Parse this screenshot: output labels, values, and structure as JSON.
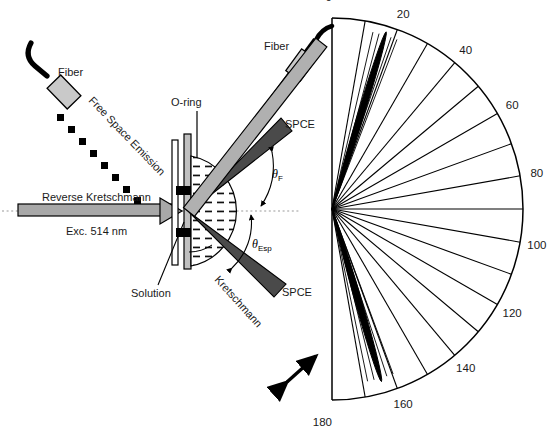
{
  "figure": {
    "background": "#ffffff",
    "width": 556,
    "height": 435
  },
  "schematic": {
    "labels": {
      "fiber_left": "Fiber",
      "fiber_right": "Fiber",
      "free_space_emission": "Free Space Emission",
      "o_ring": "O-ring",
      "spce_upper": "SPCE",
      "spce_lower": "SPCE",
      "reverse_kretschmann": "Reverse Kretschmann",
      "excitation": "Exc. 514 nm",
      "solution": "Solution",
      "kretschmann": "Kretschmann",
      "theta_f_symbol": "θ",
      "theta_f_sub": "F",
      "theta_esp_symbol": "θ",
      "theta_esp_sub": "Esp"
    },
    "colors": {
      "fiber_cable": "#000000",
      "fiber_connector": "#c9c9c9",
      "spce_beam": "#4a4a4a",
      "excitation_beam": "#a8a8a8",
      "kretschmann_arm": "#b0b0b0",
      "prism_fill": "#ffffff",
      "block_black": "#000000",
      "outline": "#000000",
      "axis_dotted": "#9a9a9a"
    },
    "geometry": {
      "optical_axis_y": 211,
      "sample_center_x": 188,
      "theta_f_degrees": 38,
      "theta_esp_degrees": 42
    }
  },
  "chart_data": {
    "type": "polar",
    "title": "",
    "xlabel": "",
    "ylabel": "",
    "angle_unit": "degrees",
    "angle_range": [
      0,
      180
    ],
    "orientation": "semicircle, 0 at top, 180 at bottom, opening to the right",
    "grid": {
      "radial_spokes_every": 10,
      "outer_arc": true,
      "spoke_count": 19
    },
    "tick_labels": [
      "0",
      "20",
      "40",
      "60",
      "80",
      "100",
      "120",
      "140",
      "160",
      "180"
    ],
    "tick_angles": [
      0,
      20,
      40,
      60,
      80,
      100,
      120,
      140,
      160,
      180
    ],
    "center_px": [
      332,
      209
    ],
    "radius_px": 191,
    "series": [
      {
        "name": "SPCE emission lobe (forward)",
        "peak_angle": 17,
        "peak_radius_fraction": 0.97,
        "angular_half_width": 2.2,
        "color": "#000000"
      },
      {
        "name": "SPCE emission lobe (backward)",
        "peak_angle": 164,
        "peak_radius_fraction": 0.94,
        "angular_half_width": 2.4,
        "color": "#000000"
      }
    ]
  }
}
